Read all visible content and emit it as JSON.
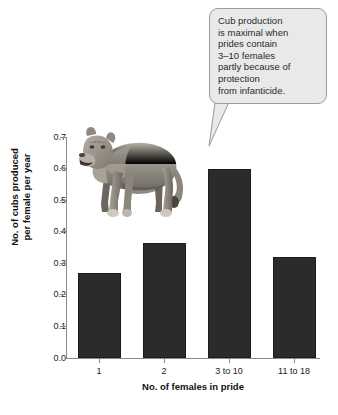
{
  "chart_data": {
    "type": "bar",
    "title": "",
    "categories": [
      "1",
      "2",
      "3 to 10",
      "11 to 18"
    ],
    "values": [
      0.27,
      0.365,
      0.6,
      0.32
    ],
    "xlabel": "No. of females in pride",
    "ylabel": "No. of cubs produced\nper female per year",
    "ylim": [
      0.0,
      0.7
    ],
    "yticks": [
      "0.0",
      "0.1",
      "0.2",
      "0.3",
      "0.4",
      "0.5",
      "0.6",
      "0.7"
    ],
    "ytick_values": [
      0.0,
      0.1,
      0.2,
      0.3,
      0.4,
      0.5,
      0.6,
      0.7
    ],
    "grid": false,
    "legend": null,
    "bar_color": "#2b2b2b",
    "axis_color": "#8a8a8a",
    "annotations": [
      {
        "text": "Cub production\nis maximal when\nprides contain\n3–10 females\npartly because of\nprotection\nfrom infanticide.",
        "points_to_category": "3 to 10",
        "fill": "#e9e9e9",
        "border": "#9a9a9a"
      }
    ],
    "illustration": "lioness-standing"
  },
  "figure": {
    "y_axis_title": "No. of cubs produced\nper female per year",
    "x_axis_title": "No. of females in pride",
    "callout_text": "Cub production\nis maximal when\nprides contain\n3–10 females\npartly because of\nprotection\nfrom infanticide."
  }
}
